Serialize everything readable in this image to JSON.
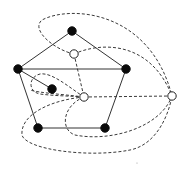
{
  "diagram": {
    "title": "",
    "colors": {
      "background": "#ffffff",
      "solid_edge": "#333333",
      "dashed_edge": "#3a3a3a",
      "black_vertex": "#0a0a0a",
      "white_vertex_fill": "#ffffff",
      "white_vertex_stroke": "#222222"
    },
    "black_vertices": [
      {
        "id": "b-top",
        "x": 72,
        "y": 31
      },
      {
        "id": "b-left",
        "x": 18,
        "y": 69
      },
      {
        "id": "b-right",
        "x": 126,
        "y": 69
      },
      {
        "id": "b-inner",
        "x": 52,
        "y": 89
      },
      {
        "id": "b-bottom-left",
        "x": 38,
        "y": 128
      },
      {
        "id": "b-bottom-right",
        "x": 105,
        "y": 128
      }
    ],
    "white_vertices": [
      {
        "id": "w-upper",
        "x": 74,
        "y": 54
      },
      {
        "id": "w-center",
        "x": 84,
        "y": 97
      },
      {
        "id": "w-far-right",
        "x": 172,
        "y": 96
      }
    ],
    "solid_edges": [
      {
        "from": "b-top",
        "to": "b-left",
        "d": "M72,31 L18,69"
      },
      {
        "from": "b-top",
        "to": "b-right",
        "d": "M72,31 L126,69"
      },
      {
        "from": "b-left",
        "to": "b-right",
        "d": "M18,69 L126,69"
      },
      {
        "from": "b-left",
        "to": "b-bottom-left",
        "d": "M18,69 L38,128"
      },
      {
        "from": "b-right",
        "to": "b-bottom-right",
        "d": "M126,69 L105,128"
      },
      {
        "from": "b-bottom-left",
        "to": "b-bottom-right",
        "d": "M38,128 L105,128"
      },
      {
        "from": "b-left",
        "to": "b-inner",
        "d": "M18,69 L52,89"
      }
    ],
    "dashed_edges": [
      {
        "from": "w-upper",
        "to": "w-center",
        "d": "M74,54 L84,97"
      },
      {
        "from": "w-center",
        "to": "w-far-right",
        "d": "M84,97 L172,96"
      },
      {
        "from": "w-upper",
        "to": "w-far-right",
        "d": "M74,54 C100,42 150,40 172,96"
      },
      {
        "from": "w-upper",
        "to": "w-far-right",
        "d": "M74,54 C55,50 30,30 42,20 C70,5 150,10 172,96"
      },
      {
        "from": "w-center",
        "to": "w-center",
        "d": "M84,97 C70,88 52,72 40,74 C28,77 28,92 40,94 C55,96 72,96 84,97"
      },
      {
        "from": "w-center",
        "to": "w-far-right",
        "d": "M84,97 C62,106 60,130 75,135 C110,142 160,128 172,96"
      },
      {
        "from": "w-center",
        "to": "w-far-right",
        "d": "M84,97 C50,100 20,115 22,135 C26,150 90,158 130,150 C155,145 168,118 172,96"
      },
      {
        "from": "w-center",
        "to": "b-left",
        "d": "M84,97 C60,94 40,93 30,90"
      }
    ],
    "artifacts": [
      {
        "x": 137,
        "y": 163,
        "r": 0.6
      }
    ]
  }
}
